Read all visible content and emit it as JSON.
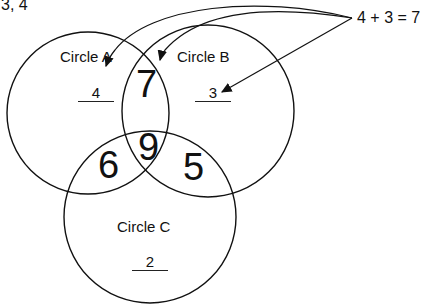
{
  "header": {
    "top_left_text": "3, 4"
  },
  "equation": "4 + 3 = 7",
  "circles": [
    {
      "name": "Circle A",
      "value": "4"
    },
    {
      "name": "Circle B",
      "value": "3"
    },
    {
      "name": "Circle C",
      "value": "2"
    }
  ],
  "intersections": {
    "ab": "7",
    "ac": "6",
    "bc": "5",
    "abc": "9"
  },
  "colors": {
    "stroke": "#111111",
    "background": "#ffffff"
  }
}
